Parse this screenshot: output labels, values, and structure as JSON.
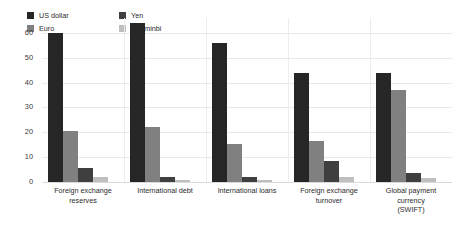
{
  "legend": {
    "position": "top-left",
    "items": [
      {
        "label": "US dollar",
        "color": "#262626",
        "swatch_icon": "square-swatch-icon"
      },
      {
        "label": "Yen",
        "color": "#3f3f3f",
        "swatch_icon": "square-swatch-icon"
      },
      {
        "label": "Euro",
        "color": "#808080",
        "swatch_icon": "square-swatch-icon"
      },
      {
        "label": "Renminbi",
        "color": "#bfbfbf",
        "swatch_icon": "square-swatch-icon"
      }
    ]
  },
  "axis": {
    "y_ticks": [
      "0",
      "10",
      "20",
      "30",
      "40",
      "50",
      "60"
    ]
  },
  "chart_data": {
    "type": "bar",
    "title": "",
    "subtitle": "",
    "xlabel": "",
    "ylabel": "",
    "ylim": [
      0,
      66
    ],
    "ytick_values": [
      0,
      10,
      20,
      30,
      40,
      50,
      60
    ],
    "grid": true,
    "legend_position": "top-left",
    "orientation": "vertical",
    "grouping": "grouped",
    "categories": [
      "Foreign exchange\nreserves",
      "International debt",
      "International loans",
      "Foreign exchange\nturnover",
      "Global payment currency\n(SWIFT)"
    ],
    "series": [
      {
        "name": "US dollar",
        "color": "#262626",
        "values": [
          60.0,
          64.0,
          56.0,
          44.0,
          44.0
        ]
      },
      {
        "name": "Euro",
        "color": "#808080",
        "values": [
          20.5,
          22.0,
          15.5,
          16.5,
          37.0
        ]
      },
      {
        "name": "Yen",
        "color": "#3f3f3f",
        "values": [
          5.5,
          2.0,
          2.0,
          8.5,
          3.5
        ]
      },
      {
        "name": "Renminbi",
        "color": "#bfbfbf",
        "values": [
          2.0,
          0.8,
          1.0,
          2.0,
          1.5
        ]
      }
    ]
  }
}
